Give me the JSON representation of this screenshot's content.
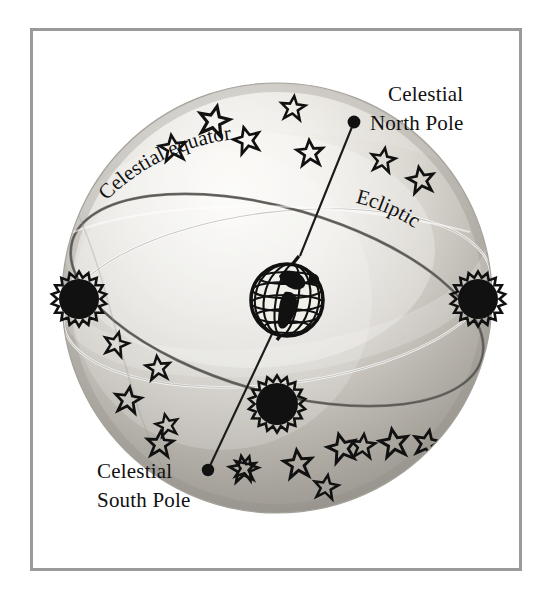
{
  "figure": {
    "background_color": "#ffffff",
    "frame_color": "#9a9a9a"
  },
  "labels": {
    "north_pole_line1": "Celestial",
    "north_pole_line2": "North Pole",
    "south_pole_line1": "Celestial",
    "south_pole_line2": "South Pole",
    "celestial_equator": "Celestial equator",
    "ecliptic": "Ecliptic"
  },
  "sphere": {
    "center_x": 277,
    "center_y": 298,
    "radius_x": 215,
    "radius_y": 215,
    "fill_light": "#f3f2ee",
    "fill_mid": "#d8d6d0",
    "fill_dark": "#bab7b0"
  },
  "axis": {
    "north_pole_point": {
      "x": 354,
      "y": 122
    },
    "south_pole_point": {
      "x": 208,
      "y": 470
    },
    "color": "#1a1a1a"
  },
  "earth": {
    "name": "earth-globe",
    "center_x": 287,
    "center_y": 300,
    "radius": 40,
    "color": "#111111"
  },
  "suns": [
    {
      "name": "sun-west",
      "x": 79,
      "y": 299,
      "r": 20
    },
    {
      "name": "sun-south",
      "x": 277,
      "y": 404,
      "r": 21
    },
    {
      "name": "sun-east",
      "x": 478,
      "y": 299,
      "r": 20
    }
  ],
  "arcs": {
    "celestial_equator_color": "#ffffff",
    "ecliptic_color": "#6f6d68"
  },
  "stars": [
    {
      "x": 173,
      "y": 148,
      "s": 13,
      "rot": -8
    },
    {
      "x": 214,
      "y": 121,
      "s": 15,
      "rot": 12
    },
    {
      "x": 247,
      "y": 140,
      "s": 13,
      "rot": -15
    },
    {
      "x": 293,
      "y": 108,
      "s": 12,
      "rot": 6
    },
    {
      "x": 310,
      "y": 153,
      "s": 13,
      "rot": -4
    },
    {
      "x": 383,
      "y": 160,
      "s": 12,
      "rot": 10
    },
    {
      "x": 421,
      "y": 180,
      "s": 13,
      "rot": -10
    },
    {
      "x": 116,
      "y": 344,
      "s": 12,
      "rot": 14
    },
    {
      "x": 158,
      "y": 368,
      "s": 12,
      "rot": -6
    },
    {
      "x": 128,
      "y": 400,
      "s": 13,
      "rot": 8
    },
    {
      "x": 167,
      "y": 425,
      "s": 11,
      "rot": -12
    },
    {
      "x": 160,
      "y": 444,
      "s": 13,
      "rot": 4
    },
    {
      "x": 243,
      "y": 469,
      "s": 13,
      "rot": -8
    },
    {
      "x": 246,
      "y": 468,
      "s": 12,
      "rot": 16
    },
    {
      "x": 298,
      "y": 464,
      "s": 14,
      "rot": -6
    },
    {
      "x": 326,
      "y": 487,
      "s": 12,
      "rot": 9
    },
    {
      "x": 342,
      "y": 448,
      "s": 14,
      "rot": -14
    },
    {
      "x": 363,
      "y": 446,
      "s": 12,
      "rot": 5
    },
    {
      "x": 394,
      "y": 443,
      "s": 14,
      "rot": -9
    },
    {
      "x": 427,
      "y": 443,
      "s": 13,
      "rot": 11
    }
  ]
}
